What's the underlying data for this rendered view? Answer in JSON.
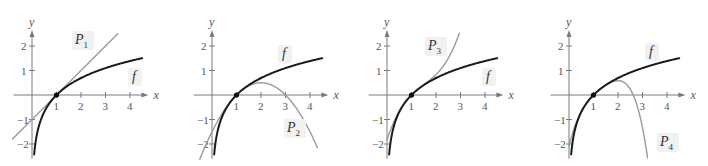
{
  "figure": {
    "colors": {
      "f_curve": "#1c1c1c",
      "p_curve": "#9a9a9a",
      "axis": "#7a7a7a",
      "label_bg": "#f1f1f1"
    },
    "axes": {
      "x_label": "x",
      "y_label": "y",
      "x_ticks": [
        "1",
        "2",
        "3",
        "4"
      ],
      "y_ticks": [
        "2",
        "1",
        "-1",
        "-2"
      ],
      "x_range": [
        -0.9,
        4.6
      ],
      "y_range": [
        -2.5,
        2.5
      ]
    },
    "panels": [
      {
        "id": "p1",
        "origin_px": [
          32,
          95
        ],
        "f_label": "f",
        "p_label": "P",
        "p_sub": "1",
        "p_label_pos": [
          75,
          44
        ],
        "f_label_pos": [
          132,
          81
        ],
        "p_x_range": [
          -0.8,
          3.5
        ],
        "f_label_bg": true,
        "p_label_bg": true
      },
      {
        "id": "p2",
        "origin_px": [
          212,
          95
        ],
        "f_label": "f",
        "p_label": "P",
        "p_sub": "2",
        "p_label_pos": [
          287,
          132
        ],
        "f_label_pos": [
          282,
          58
        ],
        "p_x_range": [
          -0.5,
          4.3
        ],
        "f_label_bg": true,
        "p_label_bg": true
      },
      {
        "id": "p3",
        "origin_px": [
          387,
          95
        ],
        "f_label": "f",
        "p_label": "P",
        "p_sub": "3",
        "p_label_pos": [
          428,
          50
        ],
        "f_label_pos": [
          486,
          81
        ],
        "p_x_range": [
          0.0,
          2.95
        ],
        "f_label_bg": true,
        "p_label_bg": true
      },
      {
        "id": "p4",
        "origin_px": [
          569,
          95
        ],
        "f_label": "f",
        "p_label": "P",
        "p_sub": "4",
        "p_label_pos": [
          660,
          146
        ],
        "f_label_pos": [
          649,
          56
        ],
        "p_x_range": [
          0.0,
          3.25
        ],
        "f_label_bg": true,
        "p_label_bg": true
      }
    ],
    "unit_px": 24.5,
    "point_label": "(1, 0)"
  },
  "chart_data": [
    {
      "type": "line",
      "title": "f(x) = ln x and first-degree Taylor polynomial P1",
      "xlabel": "x",
      "ylabel": "y",
      "xlim": [
        -0.9,
        4.6
      ],
      "ylim": [
        -2.5,
        2.5
      ],
      "x_ticks": [
        1,
        2,
        3,
        4
      ],
      "y_ticks": [
        -2,
        -1,
        1,
        2
      ],
      "series": [
        {
          "name": "f",
          "formula": "ln(x)",
          "x": [
            0.1,
            0.5,
            1,
            2,
            3,
            4,
            4.5
          ],
          "values": [
            -2.3,
            -0.69,
            0,
            0.69,
            1.1,
            1.39,
            1.5
          ]
        },
        {
          "name": "P1",
          "formula": "x-1",
          "x": [
            -0.8,
            0,
            1,
            2,
            3,
            3.5
          ],
          "values": [
            -1.8,
            -1,
            0,
            1,
            2,
            2.5
          ]
        }
      ],
      "annotations": [
        "P1",
        "f",
        "point (1,0)"
      ]
    },
    {
      "type": "line",
      "title": "f(x) = ln x and second-degree Taylor polynomial P2",
      "xlabel": "x",
      "ylabel": "y",
      "xlim": [
        -0.9,
        4.6
      ],
      "ylim": [
        -2.5,
        2.5
      ],
      "x_ticks": [
        1,
        2,
        3,
        4
      ],
      "y_ticks": [
        -2,
        -1,
        1,
        2
      ],
      "series": [
        {
          "name": "f",
          "formula": "ln(x)",
          "x": [
            0.1,
            0.5,
            1,
            2,
            3,
            4,
            4.5
          ],
          "values": [
            -2.3,
            -0.69,
            0,
            0.69,
            1.1,
            1.39,
            1.5
          ]
        },
        {
          "name": "P2",
          "formula": "(x-1)-(x-1)^2/2",
          "x": [
            -0.5,
            0,
            1,
            2,
            3,
            4,
            4.3
          ],
          "values": [
            -2.63,
            -1.5,
            0,
            0.5,
            0,
            -1.5,
            -2.15
          ]
        }
      ],
      "annotations": [
        "P2",
        "f",
        "point (1,0)"
      ]
    },
    {
      "type": "line",
      "title": "f(x) = ln x and third-degree Taylor polynomial P3",
      "xlabel": "x",
      "ylabel": "y",
      "xlim": [
        -0.9,
        4.6
      ],
      "ylim": [
        -2.5,
        2.5
      ],
      "x_ticks": [
        1,
        2,
        3,
        4
      ],
      "y_ticks": [
        -2,
        -1,
        1,
        2
      ],
      "series": [
        {
          "name": "f",
          "formula": "ln(x)",
          "x": [
            0.1,
            0.5,
            1,
            2,
            3,
            4,
            4.5
          ],
          "values": [
            -2.3,
            -0.69,
            0,
            0.69,
            1.1,
            1.39,
            1.5
          ]
        },
        {
          "name": "P3",
          "formula": "(x-1)-(x-1)^2/2+(x-1)^3/3",
          "x": [
            0,
            0.5,
            1,
            2,
            2.5,
            2.95
          ],
          "values": [
            -1.83,
            -0.67,
            0,
            0.83,
            1.5,
            2.5
          ]
        }
      ],
      "annotations": [
        "P3",
        "f",
        "point (1,0)"
      ]
    },
    {
      "type": "line",
      "title": "f(x) = ln x and fourth-degree Taylor polynomial P4",
      "xlabel": "x",
      "ylabel": "y",
      "xlim": [
        -0.9,
        4.6
      ],
      "ylim": [
        -2.5,
        2.5
      ],
      "x_ticks": [
        1,
        2,
        3,
        4
      ],
      "y_ticks": [
        -2,
        -1,
        1,
        2
      ],
      "series": [
        {
          "name": "f",
          "formula": "ln(x)",
          "x": [
            0.1,
            0.5,
            1,
            2,
            3,
            4,
            4.5
          ],
          "values": [
            -2.3,
            -0.69,
            0,
            0.69,
            1.1,
            1.39,
            1.5
          ]
        },
        {
          "name": "P4",
          "formula": "(x-1)-(x-1)^2/2+(x-1)^3/3-(x-1)^4/4",
          "x": [
            0.1,
            0.5,
            1,
            2,
            2.5,
            3,
            3.25
          ],
          "values": [
            -2.19,
            -0.68,
            0,
            0.58,
            0.23,
            -1.33,
            -2.5
          ]
        }
      ],
      "annotations": [
        "P4",
        "f",
        "point (1,0)"
      ]
    }
  ]
}
